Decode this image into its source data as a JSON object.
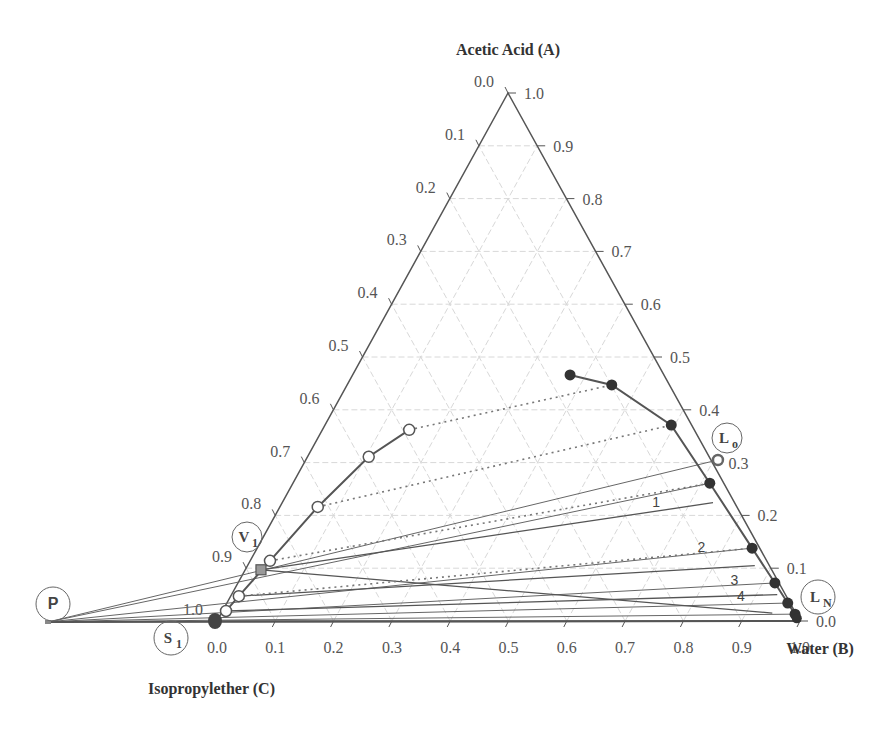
{
  "chart_data": {
    "type": "scatter",
    "subtype": "ternary",
    "title": "",
    "axes": {
      "apex_title": "Acetic Acid (A)",
      "left_title": "Isopropylether (C)",
      "right_title": "Water (B)",
      "left_ticks": [
        "0.0",
        "0.1",
        "0.2",
        "0.3",
        "0.4",
        "0.5",
        "0.6",
        "0.7",
        "0.8",
        "0.9",
        "1.0"
      ],
      "right_ticks": [
        "1.0",
        "0.9",
        "0.8",
        "0.7",
        "0.6",
        "0.5",
        "0.4",
        "0.3",
        "0.2",
        "0.1",
        "0.0"
      ],
      "bottom_ticks": [
        "0.0",
        "0.1",
        "0.2",
        "0.3",
        "0.4",
        "0.5",
        "0.6",
        "0.7",
        "0.8",
        "0.9",
        "1.0"
      ],
      "range": [
        0,
        1
      ],
      "grid": true
    },
    "series": [
      {
        "name": "Raffinate phase (water-rich) equilibrium curve",
        "marker": "filled-circle",
        "points": [
          {
            "A": 0.466,
            "B": 0.373
          },
          {
            "A": 0.447,
            "B": 0.454
          },
          {
            "A": 0.371,
            "B": 0.594
          },
          {
            "A": 0.261,
            "B": 0.715
          },
          {
            "A": 0.138,
            "B": 0.849
          },
          {
            "A": 0.072,
            "B": 0.921
          },
          {
            "A": 0.034,
            "B": 0.962
          },
          {
            "A": 0.013,
            "B": 0.985
          },
          {
            "A": 0.0,
            "B": 1.0
          }
        ]
      },
      {
        "name": "Extract phase (ether-rich) equilibrium curve",
        "marker": "open-circle",
        "points": [
          {
            "A": 0.362,
            "B": 0.149
          },
          {
            "A": 0.311,
            "B": 0.105
          },
          {
            "A": 0.216,
            "B": 0.065
          },
          {
            "A": 0.114,
            "B": 0.034
          },
          {
            "A": 0.047,
            "B": 0.014
          },
          {
            "A": 0.019,
            "B": 0.006
          }
        ]
      }
    ],
    "tie_lines_dotted": [
      {
        "from": {
          "A": 0.362,
          "B": 0.149
        },
        "to": {
          "A": 0.447,
          "B": 0.454
        }
      },
      {
        "from": {
          "A": 0.216,
          "B": 0.065
        },
        "to": {
          "A": 0.371,
          "B": 0.594
        }
      },
      {
        "from": {
          "A": 0.114,
          "B": 0.034
        },
        "to": {
          "A": 0.261,
          "B": 0.715
        }
      },
      {
        "from": {
          "A": 0.047,
          "B": 0.014
        },
        "to": {
          "A": 0.138,
          "B": 0.849
        }
      }
    ],
    "special_points": {
      "L0": {
        "label": "L",
        "sub": "o",
        "A": 0.305,
        "B": 0.707,
        "marker": "open-circle-thick"
      },
      "LN": {
        "label": "L",
        "sub": "N",
        "A": 0.0,
        "B": 1.0,
        "marker": "none"
      },
      "V1": {
        "label": "V",
        "sub": "1",
        "A": 0.097,
        "B": 0.027,
        "marker": "square"
      },
      "S1": {
        "label": "S",
        "sub": "1",
        "A": 0.0,
        "B": 0.0,
        "marker": "large-filled-circle"
      },
      "P": {
        "label": "P",
        "note": "difference point outside triangle"
      }
    },
    "operating_lines_from_P": [
      {
        "to": {
          "A": 0.305,
          "B": 0.707
        }
      },
      {
        "to": {
          "A": 0.261,
          "B": 0.715
        }
      },
      {
        "to": {
          "A": 0.138,
          "B": 0.849
        }
      },
      {
        "to": {
          "A": 0.072,
          "B": 0.921
        }
      },
      {
        "to": {
          "A": 0.034,
          "B": 0.962
        }
      },
      {
        "to": {
          "A": 0.013,
          "B": 0.985
        }
      }
    ],
    "stage_lines": [
      {
        "from": {
          "A": 0.097,
          "B": 0.027
        },
        "to": {
          "A": 0.224,
          "B": 0.739
        }
      },
      {
        "from": {
          "A": 0.047,
          "B": 0.014
        },
        "to": {
          "A": 0.105,
          "B": 0.87
        }
      },
      {
        "from": {
          "A": 0.019,
          "B": 0.006
        },
        "to": {
          "A": 0.05,
          "B": 0.936
        }
      },
      {
        "from": {
          "A": 0.097,
          "B": 0.027
        },
        "to": {
          "A": 0.015,
          "B": 0.945
        }
      }
    ],
    "stage_labels": [
      {
        "text": "1",
        "A": 0.215,
        "B": 0.646
      },
      {
        "text": "2",
        "A": 0.13,
        "B": 0.766
      },
      {
        "text": "3",
        "A": 0.069,
        "B": 0.853
      },
      {
        "text": "4",
        "A": 0.037,
        "B": 0.88
      }
    ],
    "legend": "none"
  }
}
